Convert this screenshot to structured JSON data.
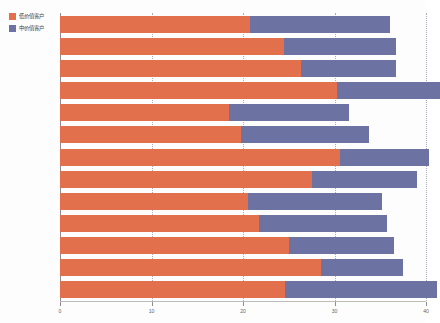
{
  "chart_data": {
    "type": "bar",
    "orientation": "horizontal",
    "stacked": true,
    "title": "",
    "subtitle": "",
    "xlabel": "",
    "ylabel": "",
    "xlim": [
      0,
      40
    ],
    "xticks": [
      0,
      10,
      20,
      30,
      40
    ],
    "xtick_labels": [
      "0",
      "10",
      "20",
      "30",
      "40"
    ],
    "yticks": [],
    "ytick_labels": [],
    "grid": "vertical-dotted",
    "legend_position": "top-left",
    "colors": {
      "low_value": "#e2704c",
      "mid_value": "#6c73a2",
      "axis": "#8d8d8d",
      "gridline": "#9aa0b5",
      "background": "#fdfdfd"
    },
    "categories": [
      "1",
      "2",
      "3",
      "4",
      "5",
      "6",
      "7",
      "8",
      "9",
      "10",
      "11",
      "12",
      "13"
    ],
    "series": [
      {
        "name": "低价值客户",
        "color": "#e2704c",
        "values": [
          20.8,
          24.5,
          26.3,
          30.3,
          18.5,
          19.8,
          30.6,
          27.5,
          20.5,
          21.8,
          25.0,
          28.5,
          24.6
        ]
      },
      {
        "name": "中价值客户",
        "color": "#6c73a2",
        "values": [
          15.3,
          12.2,
          10.4,
          11.2,
          13.1,
          14.0,
          9.7,
          11.5,
          14.7,
          13.9,
          11.5,
          9.0,
          16.6
        ]
      }
    ],
    "totals": [
      36.1,
      36.7,
      36.7,
      41.5,
      31.6,
      33.8,
      40.3,
      39.0,
      35.2,
      35.7,
      36.5,
      37.5,
      41.2
    ]
  },
  "legend": {
    "items": [
      {
        "label": "低价值客户",
        "swatch": "low"
      },
      {
        "label": "中价值客户",
        "swatch": "mid"
      }
    ]
  }
}
